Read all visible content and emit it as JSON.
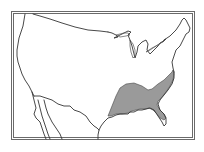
{
  "map": {
    "type": "species-range-map",
    "region": "United States (contiguous) with northern Mexico",
    "features": {
      "frame": "double-line rectangular border",
      "outline": "coastlines, Canada and Mexico borders, Great Lakes",
      "shaded_range": "southeastern United States: Gulf Coast states to Atlantic coast up to approximately Maryland/Delaware, excluding southern Florida"
    },
    "colors": {
      "background": "#ffffff",
      "lines": "#333333",
      "range_fill": "#9a9a9a"
    },
    "labels": []
  }
}
